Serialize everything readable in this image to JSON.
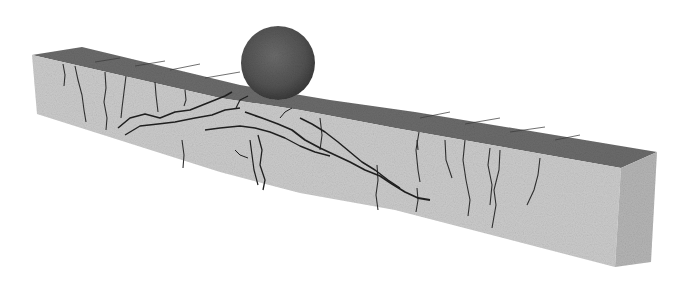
{
  "image": {
    "description": "3D rendering of a concrete beam with cracks under impact from a sphere",
    "colors": {
      "background": "#ffffff",
      "beam_front": "#c9c9c9",
      "beam_top": "#6a6a6a",
      "beam_side": "#b4b4b4",
      "sphere": "#555555",
      "crack": "#2a2a2a"
    }
  }
}
